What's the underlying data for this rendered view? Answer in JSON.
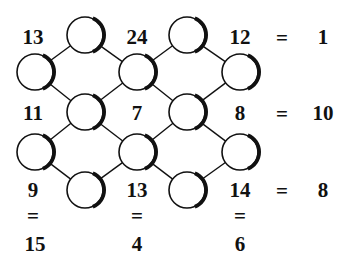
{
  "puzzle": {
    "circles": [
      {
        "id": "a1",
        "x": 85,
        "y": 35
      },
      {
        "id": "a2",
        "x": 187,
        "y": 35
      },
      {
        "id": "b1",
        "x": 35,
        "y": 72
      },
      {
        "id": "b2",
        "x": 137,
        "y": 72
      },
      {
        "id": "b3",
        "x": 240,
        "y": 72
      },
      {
        "id": "c1",
        "x": 85,
        "y": 112
      },
      {
        "id": "c2",
        "x": 187,
        "y": 112
      },
      {
        "id": "d1",
        "x": 35,
        "y": 152
      },
      {
        "id": "d2",
        "x": 137,
        "y": 152
      },
      {
        "id": "d3",
        "x": 240,
        "y": 152
      },
      {
        "id": "e1",
        "x": 85,
        "y": 190
      },
      {
        "id": "e2",
        "x": 187,
        "y": 190
      }
    ],
    "edges": [
      [
        "a1",
        "b1"
      ],
      [
        "a1",
        "b2"
      ],
      [
        "a2",
        "b2"
      ],
      [
        "a2",
        "b3"
      ],
      [
        "b1",
        "c1"
      ],
      [
        "b2",
        "c1"
      ],
      [
        "b2",
        "c2"
      ],
      [
        "b3",
        "c2"
      ],
      [
        "c1",
        "d1"
      ],
      [
        "c1",
        "d2"
      ],
      [
        "c2",
        "d2"
      ],
      [
        "c2",
        "d3"
      ],
      [
        "d1",
        "e1"
      ],
      [
        "d2",
        "e1"
      ],
      [
        "d2",
        "e2"
      ],
      [
        "d3",
        "e2"
      ]
    ],
    "row1": {
      "a": "13",
      "b": "24",
      "c": "12",
      "eq": "=",
      "result": "1"
    },
    "row2": {
      "a": "11",
      "b": "7",
      "c": "8",
      "eq": "=",
      "result": "10"
    },
    "row3": {
      "a": "9",
      "b": "13",
      "c": "14",
      "eq": "=",
      "result": "8"
    },
    "columns": {
      "eq": "=",
      "a_result": "15",
      "b_result": "4",
      "c_result": "6"
    },
    "colors": {
      "stroke": "#111111",
      "fill": "#ffffff"
    }
  }
}
